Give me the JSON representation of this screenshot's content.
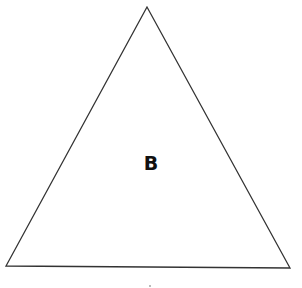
{
  "diagram": {
    "shape": "triangle",
    "label": "B",
    "stroke_color": "#333333",
    "fill_color": "#ffffff",
    "background_color": "#ffffff",
    "vertices": [
      {
        "name": "apex",
        "x": 147,
        "y": 7
      },
      {
        "name": "bottom-left",
        "x": 6,
        "y": 266
      },
      {
        "name": "bottom-right",
        "x": 290,
        "y": 268
      }
    ]
  }
}
